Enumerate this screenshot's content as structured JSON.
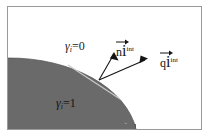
{
  "figure": {
    "type": "interface-normal-heat-flux-diagram",
    "background_color": "#ffffff",
    "frame_color": "#9a9a9a",
    "phase_fill_color": "#6a6a6a",
    "line_color": "#1b1b1b",
    "tangent_color": "#cfcfcf"
  },
  "regions": [
    {
      "id": "phase-zero",
      "label_symbol": "γ",
      "label_subscript": "i",
      "label_equals": "=",
      "label_value": "0",
      "fill": "#ffffff",
      "description": "outer white region"
    },
    {
      "id": "phase-one",
      "label_symbol": "γ",
      "label_subscript": "i",
      "label_equals": "=",
      "label_value": "1",
      "fill": "#6a6a6a",
      "description": "gray quarter-disk region lower left"
    }
  ],
  "vectors": [
    {
      "id": "normal-vector",
      "base": "n",
      "subscript": "i",
      "superscript": "int",
      "origin": [
        98,
        79
      ],
      "tip": [
        113,
        52
      ],
      "description": "interface unit normal"
    },
    {
      "id": "heat-flux-vector",
      "base": "q",
      "subscript": "i",
      "superscript": "int",
      "origin": [
        98,
        79
      ],
      "tip": [
        146,
        58
      ],
      "description": "interface heat flux"
    }
  ],
  "geometry": {
    "interface_curve": "circular arc separating phases",
    "tangent_line_shown": true,
    "arc_start": [
      0,
      58
    ],
    "arc_end": [
      135,
      124
    ]
  }
}
